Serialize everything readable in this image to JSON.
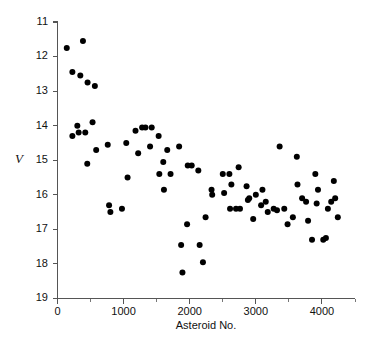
{
  "chart_data": {
    "type": "scatter",
    "title": "",
    "xlabel": "Asteroid No.",
    "ylabel": "V",
    "xlim": [
      0,
      4500
    ],
    "ylim": [
      19,
      11
    ],
    "y_inverted": true,
    "grid": false,
    "legend": null,
    "x_ticks": [
      0,
      1000,
      2000,
      3000,
      4000
    ],
    "x_tick_labels": [
      "0",
      "1000",
      "2000",
      "3000",
      "4000"
    ],
    "x_minor_ticks": [
      500,
      1500,
      2500,
      3500,
      4500
    ],
    "y_ticks": [
      11,
      12,
      13,
      14,
      15,
      16,
      17,
      18,
      19
    ],
    "y_tick_labels": [
      "11",
      "12",
      "13",
      "14",
      "15",
      "16",
      "17",
      "18",
      "19"
    ],
    "marker": "filled-circle",
    "marker_color": "#000000",
    "marker_size": 3.0,
    "points": [
      [
        140,
        11.75
      ],
      [
        385,
        11.55
      ],
      [
        225,
        12.45
      ],
      [
        345,
        12.55
      ],
      [
        455,
        12.75
      ],
      [
        565,
        12.85
      ],
      [
        300,
        14.0
      ],
      [
        225,
        14.3
      ],
      [
        320,
        14.2
      ],
      [
        530,
        13.9
      ],
      [
        420,
        14.2
      ],
      [
        585,
        14.7
      ],
      [
        450,
        15.1
      ],
      [
        760,
        14.55
      ],
      [
        1040,
        14.5
      ],
      [
        1180,
        14.15
      ],
      [
        1280,
        14.05
      ],
      [
        1330,
        14.05
      ],
      [
        1425,
        14.05
      ],
      [
        1220,
        14.8
      ],
      [
        1400,
        14.6
      ],
      [
        1530,
        14.3
      ],
      [
        1660,
        14.7
      ],
      [
        1840,
        14.6
      ],
      [
        1600,
        15.05
      ],
      [
        1710,
        15.4
      ],
      [
        2030,
        15.15
      ],
      [
        2130,
        15.3
      ],
      [
        1970,
        15.15
      ],
      [
        1060,
        15.5
      ],
      [
        1540,
        15.4
      ],
      [
        1610,
        15.85
      ],
      [
        780,
        16.3
      ],
      [
        800,
        16.5
      ],
      [
        975,
        16.4
      ],
      [
        1960,
        16.85
      ],
      [
        2240,
        16.65
      ],
      [
        1870,
        17.45
      ],
      [
        2150,
        17.45
      ],
      [
        2200,
        17.95
      ],
      [
        1890,
        18.25
      ],
      [
        2330,
        15.85
      ],
      [
        2340,
        16.0
      ],
      [
        2500,
        15.4
      ],
      [
        2520,
        15.95
      ],
      [
        2600,
        15.4
      ],
      [
        2630,
        15.7
      ],
      [
        2740,
        15.2
      ],
      [
        2610,
        16.4
      ],
      [
        2700,
        16.4
      ],
      [
        2760,
        16.4
      ],
      [
        2860,
        15.75
      ],
      [
        2900,
        16.1
      ],
      [
        2880,
        16.15
      ],
      [
        3000,
        16.0
      ],
      [
        2960,
        16.7
      ],
      [
        3080,
        16.3
      ],
      [
        3100,
        15.85
      ],
      [
        3150,
        16.2
      ],
      [
        3180,
        16.5
      ],
      [
        3270,
        16.4
      ],
      [
        3320,
        16.45
      ],
      [
        3360,
        14.6
      ],
      [
        3430,
        16.4
      ],
      [
        3480,
        16.85
      ],
      [
        3560,
        16.65
      ],
      [
        3620,
        14.9
      ],
      [
        3630,
        15.7
      ],
      [
        3700,
        16.1
      ],
      [
        3760,
        16.2
      ],
      [
        3790,
        16.75
      ],
      [
        3850,
        17.3
      ],
      [
        3900,
        15.4
      ],
      [
        3920,
        16.25
      ],
      [
        3940,
        15.85
      ],
      [
        4020,
        17.3
      ],
      [
        4060,
        17.25
      ],
      [
        4090,
        16.4
      ],
      [
        4140,
        16.2
      ],
      [
        4180,
        15.6
      ],
      [
        4200,
        16.1
      ],
      [
        4240,
        16.65
      ]
    ]
  },
  "figure": {
    "background_color": "#ffffff",
    "axis_color": "#555555"
  }
}
